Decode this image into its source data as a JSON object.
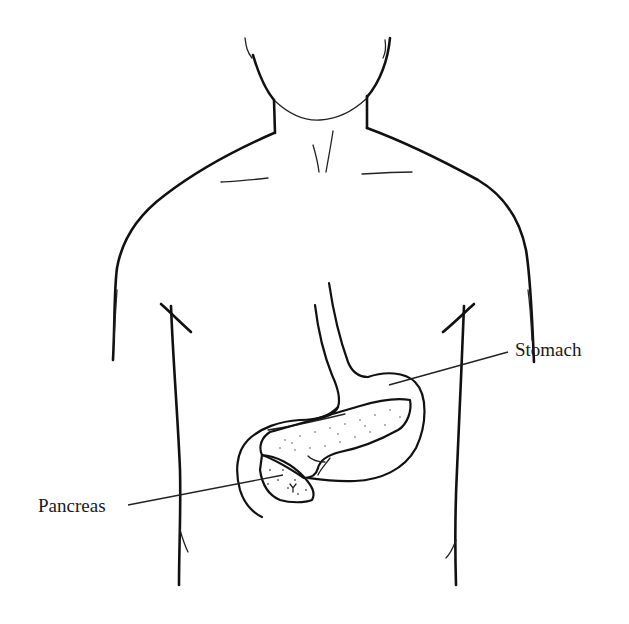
{
  "diagram": {
    "type": "anatomical-illustration",
    "style": "black line drawing on white background",
    "colors": {
      "background": "#ffffff",
      "line": "#111111",
      "label_text": "#1a1a1a"
    }
  },
  "labels": [
    {
      "id": "stomach",
      "text": "Stomach",
      "points_to": "stomach"
    },
    {
      "id": "pancreas",
      "text": "Pancreas",
      "points_to": "pancreas"
    }
  ]
}
